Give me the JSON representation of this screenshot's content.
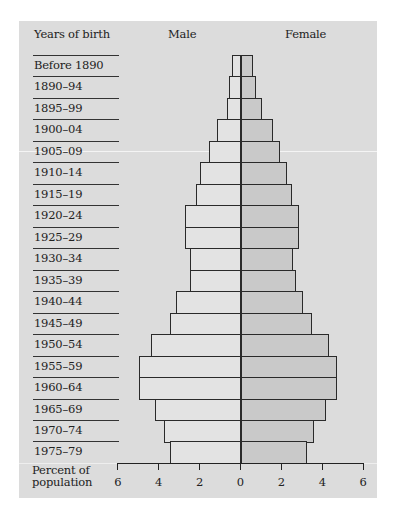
{
  "header": {
    "years_label": "Years of birth",
    "male_label": "Male",
    "female_label": "Female"
  },
  "axis": {
    "label_line1": "Percent of",
    "label_line2": "population",
    "ticks": [
      "6",
      "4",
      "2",
      "0",
      "2",
      "4",
      "6"
    ]
  },
  "chart_data": {
    "type": "bar",
    "subtype": "population-pyramid (horizontal, mirrored)",
    "title": "",
    "xlabel": "Percent of population",
    "ylabel": "Years of birth",
    "xlim": [
      -6,
      6
    ],
    "x_ticks": [
      -6,
      -4,
      -2,
      0,
      2,
      4,
      6
    ],
    "x_tick_labels": [
      "6",
      "4",
      "2",
      "0",
      "2",
      "4",
      "6"
    ],
    "grid": false,
    "legend": [
      "Male",
      "Female"
    ],
    "categories": [
      "Before 1890",
      "1890–94",
      "1895–99",
      "1900–04",
      "1905–09",
      "1910–14",
      "1915–19",
      "1920–24",
      "1925–29",
      "1930–34",
      "1935–39",
      "1940–44",
      "1945–49",
      "1950–54",
      "1955–59",
      "1960–64",
      "1965–69",
      "1970–74",
      "1975–79"
    ],
    "series": [
      {
        "name": "Male",
        "values": [
          0.4,
          0.55,
          0.65,
          1.15,
          1.55,
          2.0,
          2.2,
          2.7,
          2.7,
          2.45,
          2.45,
          3.15,
          3.45,
          4.4,
          4.95,
          4.95,
          4.2,
          3.75,
          3.45
        ]
      },
      {
        "name": "Female",
        "values": [
          0.6,
          0.75,
          1.05,
          1.6,
          1.95,
          2.25,
          2.5,
          2.85,
          2.85,
          2.55,
          2.7,
          3.05,
          3.5,
          4.35,
          4.7,
          4.7,
          4.2,
          3.6,
          3.25
        ]
      }
    ]
  }
}
